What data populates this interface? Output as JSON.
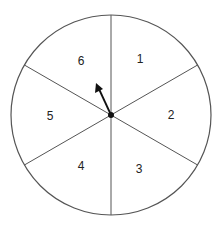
{
  "spinner": {
    "sectors": [
      {
        "label": "1"
      },
      {
        "label": "2"
      },
      {
        "label": "3"
      },
      {
        "label": "4"
      },
      {
        "label": "5"
      },
      {
        "label": "6"
      }
    ],
    "pointer": "arrow pointing toward sector 6"
  }
}
